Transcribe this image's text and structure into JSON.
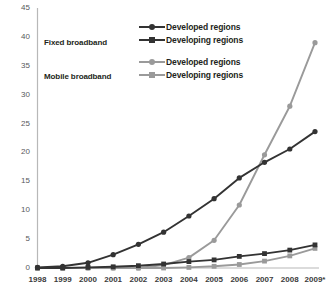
{
  "chart_data": {
    "type": "line",
    "title": "",
    "subtitle": "",
    "xlabel": "",
    "ylabel": "",
    "ylim": [
      0,
      45
    ],
    "ytick_step": 5,
    "yticks": [
      "0",
      "5",
      "10",
      "15",
      "20",
      "25",
      "30",
      "35",
      "40",
      "45"
    ],
    "grid": false,
    "legend_position": "top-center",
    "categories": [
      "1998",
      "1999",
      "2000",
      "2001",
      "2002",
      "2003",
      "2004",
      "2005",
      "2006",
      "2007",
      "2008",
      "2009*"
    ],
    "series": [
      {
        "name": "Developed regions",
        "group": "Fixed broadband",
        "color": "#333333",
        "marker": "circle",
        "values": [
          0.1,
          0.3,
          0.9,
          2.3,
          4.1,
          6.2,
          9.0,
          12.0,
          15.6,
          18.3,
          20.6,
          23.6
        ]
      },
      {
        "name": "Developing regions",
        "group": "Fixed broadband",
        "color": "#333333",
        "marker": "square",
        "values": [
          0.0,
          0.0,
          0.1,
          0.2,
          0.4,
          0.7,
          1.1,
          1.4,
          2.0,
          2.5,
          3.1,
          4.0
        ]
      },
      {
        "name": "Developed regions",
        "group": "Mobile broadband",
        "color": "#9a9a9a",
        "marker": "circle",
        "values": [
          0.0,
          0.0,
          0.0,
          0.0,
          0.0,
          0.5,
          1.8,
          4.8,
          10.9,
          19.6,
          28.0,
          39.0
        ]
      },
      {
        "name": "Developing regions",
        "group": "Mobile broadband",
        "color": "#9a9a9a",
        "marker": "square",
        "values": [
          0.0,
          0.0,
          0.0,
          0.0,
          0.0,
          0.0,
          0.1,
          0.3,
          0.6,
          1.2,
          2.1,
          3.4
        ]
      }
    ]
  },
  "axis": {
    "line_color": "#b8b8b8"
  },
  "groups": [
    {
      "label": "Fixed broadband"
    },
    {
      "label": "Mobile broadband"
    }
  ],
  "legend": {
    "entries": [
      {
        "label": "Developed regions",
        "color": "#333333",
        "marker": "circle"
      },
      {
        "label": "Developing regions",
        "color": "#333333",
        "marker": "square"
      },
      {
        "label": "Developed regions",
        "color": "#9a9a9a",
        "marker": "circle"
      },
      {
        "label": "Developing regions",
        "color": "#9a9a9a",
        "marker": "square"
      }
    ]
  }
}
